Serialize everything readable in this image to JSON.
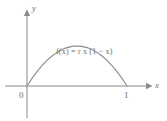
{
  "figure": {
    "background_color": "#ffffff",
    "stroke_color": "#8a8a8a",
    "text_color": "#6f6f6f",
    "formula": "f(x) = r x (1 − x)"
  },
  "axes": {
    "x_label": "x",
    "y_label": "y",
    "origin_label": "0",
    "x_tick_label": "1"
  },
  "chart_data": {
    "type": "line",
    "title": "",
    "subtitle": "",
    "xlabel": "x",
    "ylabel": "y",
    "annotations": [
      {
        "text": "f(x) = r x (1 − x)",
        "x": 0.5,
        "y": 0.32
      }
    ],
    "xlim": [
      -0.22,
      1.21
    ],
    "ylim": [
      -0.32,
      0.72
    ],
    "xticks": [
      0,
      1
    ],
    "xticklabels": [
      "0",
      "1"
    ],
    "yticks": [],
    "yticklabels": [],
    "grid": false,
    "legend": null,
    "series": [
      {
        "name": "f(x) = r x (1 - x)",
        "equation": "f(x) = r*x*(1-x)",
        "color": "#8a8a8a",
        "x": [
          0,
          0.05,
          0.1,
          0.15,
          0.2,
          0.25,
          0.3,
          0.35,
          0.4,
          0.45,
          0.5,
          0.55,
          0.6,
          0.65,
          0.7,
          0.75,
          0.8,
          0.85,
          0.9,
          0.95,
          1
        ],
        "values": [
          0,
          0.038,
          0.072,
          0.102,
          0.128,
          0.15,
          0.168,
          0.182,
          0.192,
          0.198,
          0.2,
          0.198,
          0.192,
          0.182,
          0.168,
          0.15,
          0.128,
          0.102,
          0.072,
          0.038,
          0
        ]
      }
    ]
  }
}
